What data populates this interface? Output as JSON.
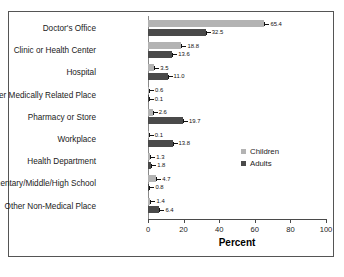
{
  "chart_data": {
    "type": "bar",
    "orientation": "horizontal",
    "title": "",
    "xlabel": "Percent",
    "ylabel": "",
    "xlim": [
      0,
      100
    ],
    "xticks": [
      0,
      20,
      40,
      60,
      80,
      100
    ],
    "grid": false,
    "legend_position": "middle-right",
    "categories": [
      "Doctor's Office",
      "Clinic or Health Center",
      "Hospital",
      "Other Medically Related Place",
      "Pharmacy or Store",
      "Workplace",
      "Health Department",
      "Elementary/Middle/High School",
      "Other Non-Medical Place"
    ],
    "series": [
      {
        "name": "Children",
        "color": "#b3b3b3",
        "values": [
          65.4,
          18.8,
          3.5,
          0.6,
          2.6,
          0.1,
          1.3,
          4.7,
          1.4
        ],
        "labels": [
          "65.4",
          "18.8",
          "3.5",
          "0.6",
          "2.6",
          "0.1",
          "1.3",
          "4.7",
          "1.4"
        ]
      },
      {
        "name": "Adults",
        "color": "#4a4a4a",
        "values": [
          32.5,
          13.6,
          11.0,
          0.1,
          19.7,
          13.8,
          1.8,
          0.8,
          6.4
        ],
        "labels": [
          "32.5",
          "13.6",
          "11.0",
          "0.1",
          "19.7",
          "13.8",
          "1.8",
          "0.8",
          "6.4"
        ]
      }
    ]
  },
  "legend": {
    "items": [
      {
        "label": "Children",
        "color": "#b3b3b3"
      },
      {
        "label": "Adults",
        "color": "#4a4a4a"
      }
    ]
  }
}
